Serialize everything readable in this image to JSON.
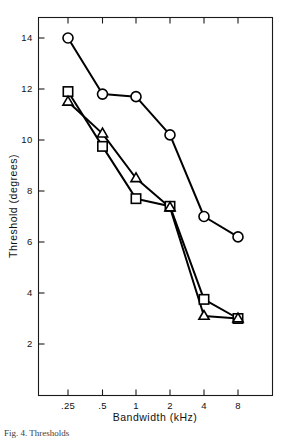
{
  "figure": {
    "caption_fragment": "Fig. 4.  Thresholds",
    "background": "#ffffff",
    "ink_color": "#000000"
  },
  "chart_data": {
    "type": "line",
    "title": "",
    "xlabel": "Bandwidth (kHz)",
    "ylabel": "Threshold  (degrees)",
    "x_scale": "log2",
    "x": [
      0.25,
      0.5,
      1,
      2,
      4,
      8
    ],
    "xtick_labels": [
      ".25",
      ".5",
      "1",
      "2",
      "4",
      "8"
    ],
    "ytick_labels": [
      "2",
      "4",
      "6",
      "8",
      "10",
      "12",
      "14"
    ],
    "yticks": [
      2,
      4,
      6,
      8,
      10,
      12,
      14
    ],
    "ylim": [
      0.5,
      15.4
    ],
    "grid": false,
    "legend": "none",
    "series": [
      {
        "name": "circle-series",
        "marker": "circle",
        "values": [
          14.0,
          11.8,
          11.7,
          10.2,
          7.0,
          6.2
        ]
      },
      {
        "name": "square-series",
        "marker": "square",
        "values": [
          11.9,
          9.75,
          7.7,
          7.4,
          3.75,
          3.0
        ]
      },
      {
        "name": "triangle-series",
        "marker": "triangle",
        "values": [
          11.5,
          10.25,
          8.5,
          7.35,
          3.1,
          3.0
        ]
      }
    ]
  }
}
